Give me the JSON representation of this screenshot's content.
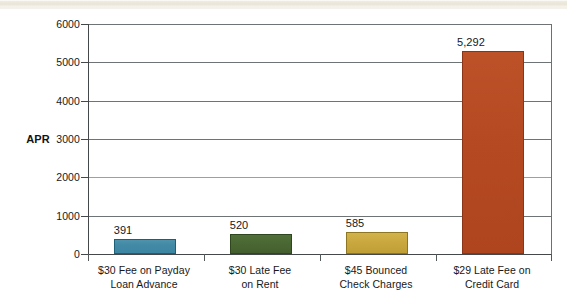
{
  "chart_data": {
    "type": "bar",
    "title": "",
    "xlabel": "",
    "ylabel": "APR",
    "ylim": [
      0,
      6000
    ],
    "ytick_values": [
      0,
      1000,
      2000,
      3000,
      4000,
      5000,
      6000
    ],
    "ytick_labels": [
      "0",
      "1000",
      "2000",
      "3000",
      "4000",
      "5000",
      "6000"
    ],
    "grid": true,
    "legend": "none",
    "categories": [
      "$30 Fee on Payday Loan Advance",
      "$30 Late Fee on Rent",
      "$45 Bounced Check Charges",
      "$29 Late Fee on Credit Card"
    ],
    "category_lines": [
      [
        "$30 Fee on Payday",
        "Loan Advance"
      ],
      [
        "$30 Late Fee",
        "on Rent"
      ],
      [
        "$45 Bounced",
        "Check Charges"
      ],
      [
        "$29 Late Fee on",
        "Credit Card"
      ]
    ],
    "values": [
      391,
      520,
      585,
      5292
    ],
    "value_labels": [
      "391",
      "520",
      "585",
      "5,292"
    ],
    "colors": [
      "#4189a5",
      "#4a6833",
      "#c9a93f",
      "#b64a22"
    ]
  },
  "axis": {
    "y_title": "APR"
  }
}
